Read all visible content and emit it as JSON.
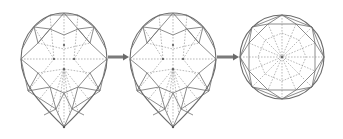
{
  "diagram": {
    "stages": [
      {
        "id": "pear-cut-1",
        "shape": "pear",
        "label": ""
      },
      {
        "id": "pear-cut-2",
        "shape": "pear",
        "label": ""
      },
      {
        "id": "round-brilliant-cut",
        "shape": "round",
        "label": ""
      }
    ],
    "connectors": [
      {
        "from": "pear-cut-1",
        "to": "pear-cut-2",
        "type": "arrow"
      },
      {
        "from": "pear-cut-2",
        "to": "round-brilliant-cut",
        "type": "arrow"
      }
    ],
    "colors": {
      "line": "#6a6a6a",
      "dashed_line": "#8a8a8a",
      "arrow": "#7a7a7a",
      "background": "#ffffff"
    }
  }
}
